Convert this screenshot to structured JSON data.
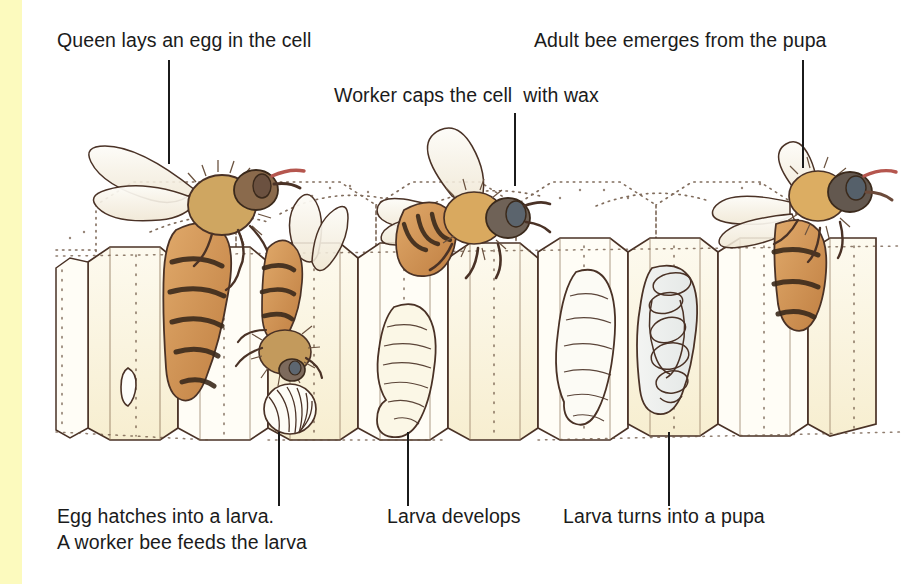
{
  "figure": {
    "background_color": "#ffffff",
    "left_band_color": "#fcfabe",
    "ink_color": "#4a3226",
    "text_color": "#1b1b1b",
    "comb_wax_color": "#fbf4da",
    "bee_body_color": "#cf8c4e",
    "bee_stripe_color": "#3b2a1c",
    "larva_color": "#fbfaf3",
    "pupa_color": "#eef0ef"
  },
  "labels": {
    "top_left": "Queen lays an egg in the cell",
    "top_middle": "Worker caps the cell  with wax",
    "top_right": "Adult bee emerges from the pupa",
    "bottom_left_line1": "Egg hatches into a larva.",
    "bottom_left_line2": "A worker bee feeds the larva",
    "bottom_middle": "Larva develops",
    "bottom_right": "Larva turns into a pupa"
  },
  "leaders": [
    {
      "name": "leader-queen-lays-egg",
      "x": 168,
      "y": 60,
      "length": 104
    },
    {
      "name": "leader-worker-caps-cell",
      "x": 514,
      "y": 113,
      "length": 73
    },
    {
      "name": "leader-adult-emerges",
      "x": 802,
      "y": 60,
      "length": 108
    },
    {
      "name": "leader-egg-hatches",
      "x": 278,
      "y": 432,
      "length": 74
    },
    {
      "name": "leader-larva-develops",
      "x": 407,
      "y": 432,
      "length": 74
    },
    {
      "name": "leader-larva-pupa",
      "x": 668,
      "y": 432,
      "length": 74
    }
  ],
  "illustration": {
    "type": "hand-drawn ink and watercolour cutaway of honeycomb",
    "elements": [
      {
        "name": "queen-bee",
        "stage": "laying an egg",
        "position": "upper left"
      },
      {
        "name": "egg-in-cell",
        "stage": "egg",
        "position": "left cell"
      },
      {
        "name": "worker-bee-feeding",
        "stage": "feeding larva",
        "position": "left-centre"
      },
      {
        "name": "coiled-larva",
        "stage": "young larva",
        "position": "left-centre cell"
      },
      {
        "name": "larva-developing",
        "stage": "larva",
        "position": "centre cell"
      },
      {
        "name": "worker-bee-capping",
        "stage": "capping cell with wax",
        "position": "centre"
      },
      {
        "name": "larva-grown",
        "stage": "grown larva",
        "position": "centre-right cell"
      },
      {
        "name": "pupa-in-cell",
        "stage": "pupa",
        "position": "right cell"
      },
      {
        "name": "adult-bee",
        "stage": "emerged adult",
        "position": "upper right"
      }
    ]
  }
}
